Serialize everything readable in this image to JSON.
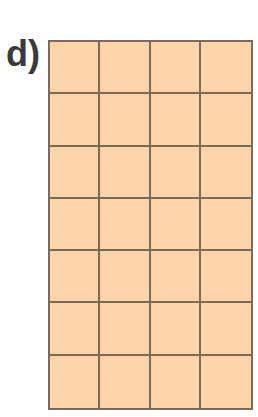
{
  "label": "d)",
  "grid": {
    "rows": 7,
    "columns": 4,
    "fill_color": "#fcd6aa",
    "line_color": "#7a6b5a"
  }
}
